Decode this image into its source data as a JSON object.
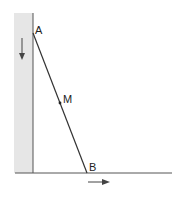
{
  "diagram": {
    "points": {
      "A": {
        "label": "A"
      },
      "M": {
        "label": "M"
      },
      "B": {
        "label": "B"
      }
    },
    "arrows": {
      "wall_direction": "down",
      "floor_direction": "right"
    },
    "colors": {
      "wall_fill": "#e6e6e6",
      "line": "#333333",
      "label": "#222222"
    }
  }
}
